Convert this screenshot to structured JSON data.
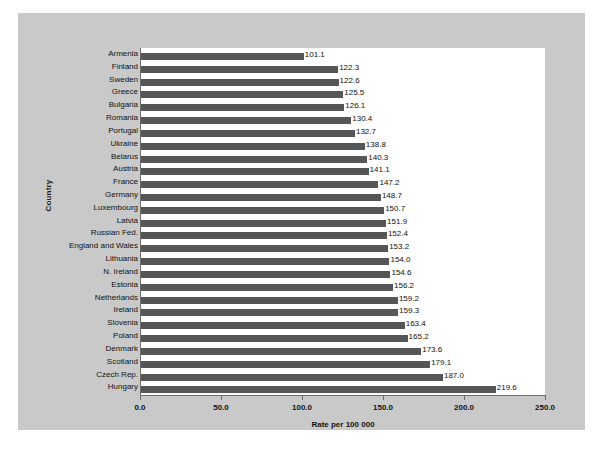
{
  "chart_data": {
    "type": "bar",
    "orientation": "horizontal",
    "title": "",
    "xlabel": "Rate per 100 000",
    "ylabel": "Country",
    "xlim": [
      0.0,
      250.0
    ],
    "xticks": [
      "0.0",
      "50.0",
      "100.0",
      "150.0",
      "200.0",
      "250.0"
    ],
    "xtick_values": [
      0,
      50,
      100,
      150,
      200,
      250
    ],
    "grid": false,
    "legend": null,
    "bar_color": "#565656",
    "panel_color": "#c9c9c9",
    "plot_bg": "#ffffff",
    "categories": [
      "Armenia",
      "Finland",
      "Sweden",
      "Greece",
      "Bulgaria",
      "Romania",
      "Portugal",
      "Ukraine",
      "Belarus",
      "Austria",
      "France",
      "Germany",
      "Luxembourg",
      "Latvia",
      "Russian Fed.",
      "England and Wales",
      "Lithuania",
      "N. Ireland",
      "Estonia",
      "Netherlands",
      "Ireland",
      "Slovenia",
      "Poland",
      "Denmark",
      "Scotland",
      "Czech Rep.",
      "Hungary"
    ],
    "values": [
      101.1,
      122.3,
      122.6,
      125.5,
      126.1,
      130.4,
      132.7,
      138.8,
      140.3,
      141.1,
      147.2,
      148.7,
      150.7,
      151.9,
      152.4,
      153.2,
      154.0,
      154.6,
      156.2,
      159.2,
      159.3,
      163.4,
      165.2,
      173.6,
      179.1,
      187.0,
      219.6
    ],
    "value_labels": [
      "101.1",
      "122.3",
      "122.6",
      "125.5",
      "126.1",
      "130.4",
      "132.7",
      "138.8",
      "140.3",
      "141.1",
      "147.2",
      "148.7",
      "150.7",
      "151.9",
      "152.4",
      "153.2",
      "154.0",
      "154.6",
      "156.2",
      "159.2",
      "159.3",
      "163.4",
      "165.2",
      "173.6",
      "179.1",
      "187.0",
      "219.6"
    ]
  }
}
